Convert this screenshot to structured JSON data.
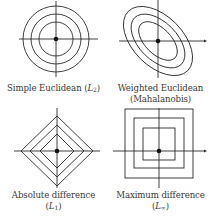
{
  "panels": [
    {
      "id": "simple-euclidean",
      "shape": "concentric-circles",
      "label_line1": "Simple Euclidean (",
      "label_var": "L",
      "label_sub": "2",
      "label_close": ")"
    },
    {
      "id": "weighted-euclidean",
      "shape": "concentric-rotated-ellipses",
      "label_line1": "Weighted Euclidean",
      "label_line2": "(Mahalanobis)"
    },
    {
      "id": "absolute-difference",
      "shape": "concentric-diamonds",
      "label_line1": "Absolute difference",
      "label_open": "(",
      "label_var": "L",
      "label_sub": "1",
      "label_close": ")"
    },
    {
      "id": "maximum-difference",
      "shape": "concentric-squares",
      "label_line1": "Maximum difference",
      "label_open": "(",
      "label_var": "L",
      "label_sub": "∞",
      "label_close": ")"
    }
  ],
  "colors": {
    "stroke": "#2b2b2b",
    "text": "#3a3a3a",
    "background": "#ffffff"
  }
}
